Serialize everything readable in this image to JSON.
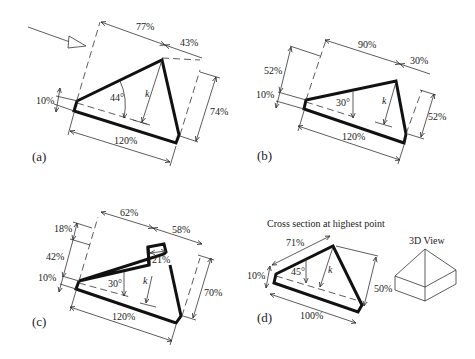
{
  "figure": {
    "panels": [
      {
        "id": "a",
        "label": "(a)",
        "angle": "44°",
        "k_label": "k",
        "dims": {
          "top_left": "77%",
          "top_right": "43%",
          "right": "74%",
          "left": "10%",
          "bottom": "120%"
        },
        "has_flow_arrow": true
      },
      {
        "id": "b",
        "label": "(b)",
        "angle": "30°",
        "k_label": "k",
        "dims": {
          "top_left": "90%",
          "top_right": "30%",
          "right": "52%",
          "left_upper": "52%",
          "left": "10%",
          "bottom": "120%"
        }
      },
      {
        "id": "c",
        "label": "(c)",
        "angle": "30°",
        "k_label": "k",
        "dims": {
          "top_left": "62%",
          "top_right": "58%",
          "right": "70%",
          "left_top": "18%",
          "left_mid": "42%",
          "left": "10%",
          "bottom": "120%",
          "notch": "21%"
        }
      },
      {
        "id": "d",
        "label": "(d)",
        "title": "Cross section at highest point",
        "angle": "45°",
        "k_label": "k",
        "dims": {
          "top": "71%",
          "right": "50%",
          "left": "10%",
          "bottom": "100%"
        },
        "inset_title": "3D View"
      }
    ]
  }
}
